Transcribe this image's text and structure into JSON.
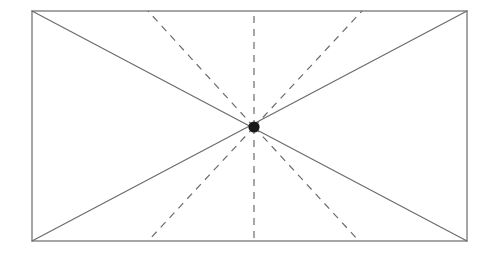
{
  "canvas": {
    "width": 498,
    "height": 262,
    "background_color": "#ffffff"
  },
  "figure": {
    "name": "rectangle-with-radiating-lines"
  },
  "style": {
    "solid_line_color": "#6b6b6b",
    "dashed_line_color": "#6b6b6b",
    "border_color": "#6b6b6b",
    "center_point_color": "#1a1a1a",
    "solid_line_width": 1.2,
    "dashed_line_width": 1.2,
    "border_width": 1.2,
    "dash_pattern": "7 6",
    "center_point_radius": 5.6
  },
  "geometry": {
    "rectangle": {
      "left": 32,
      "top": 11,
      "right": 467,
      "bottom": 241,
      "width": 435,
      "height": 230
    },
    "center_point": {
      "x": 254,
      "y": 127,
      "label": "center-point"
    },
    "corners": [
      {
        "name": "top-left",
        "x": 32,
        "y": 11
      },
      {
        "name": "top-right",
        "x": 467,
        "y": 11
      },
      {
        "name": "bottom-right",
        "x": 467,
        "y": 241
      },
      {
        "name": "bottom-left",
        "x": 32,
        "y": 241
      }
    ],
    "solid_diagonals": [
      {
        "name": "diagonal-tl-br",
        "x1": 32,
        "y1": 11,
        "x2": 467,
        "y2": 241
      },
      {
        "name": "diagonal-bl-tr",
        "x1": 32,
        "y1": 241,
        "x2": 467,
        "y2": 11
      }
    ],
    "dashed_rays": [
      {
        "name": "ray-up-left",
        "x1": 254,
        "y1": 127,
        "x2": 148,
        "y2": 11
      },
      {
        "name": "ray-up-vertical",
        "x1": 254,
        "y1": 127,
        "x2": 254,
        "y2": 11
      },
      {
        "name": "ray-up-right",
        "x1": 254,
        "y1": 127,
        "x2": 362,
        "y2": 11
      },
      {
        "name": "ray-down-left",
        "x1": 254,
        "y1": 127,
        "x2": 148,
        "y2": 241
      },
      {
        "name": "ray-down-vertical",
        "x1": 254,
        "y1": 127,
        "x2": 254,
        "y2": 241
      },
      {
        "name": "ray-down-right",
        "x1": 254,
        "y1": 127,
        "x2": 359,
        "y2": 241
      }
    ]
  }
}
